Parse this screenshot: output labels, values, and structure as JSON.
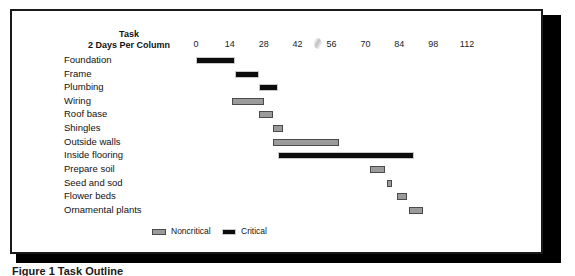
{
  "figure": {
    "caption": "Figure 1   Task Outline"
  },
  "header": {
    "task_line1": "Task",
    "task_line2": "2 Days Per Column"
  },
  "legend": {
    "items": [
      {
        "label": "Noncritical",
        "kind": "noncritical",
        "color": "#9b9b9b"
      },
      {
        "label": "Critical",
        "kind": "critical",
        "color": "#0c0c0c"
      }
    ]
  },
  "chart_data": {
    "type": "bar",
    "title": "Task Outline",
    "subtitle": "2 Days Per Column",
    "xlabel": "Days",
    "ylabel": "Task",
    "orientation": "horizontal",
    "grid": false,
    "legend_position": "bottom",
    "xlim": [
      0,
      126
    ],
    "xticks": [
      0,
      14,
      28,
      42,
      56,
      70,
      84,
      98,
      112
    ],
    "xtick_labels": [
      "0",
      "14",
      "28",
      "42",
      "56",
      "70",
      "84",
      "98",
      "112"
    ],
    "units": "days",
    "categories": [
      "Foundation",
      "Frame",
      "Plumbing",
      "Wiring",
      "Roof base",
      "Shingles",
      "Outside walls",
      "Inside flooring",
      "Prepare soil",
      "Seed and sod",
      "Flower beds",
      "Ornamental plants"
    ],
    "series": [
      {
        "name": "Critical",
        "color": "#0c0c0c",
        "tasks": [
          {
            "task": "Foundation",
            "start": 0,
            "end": 16,
            "duration": 16,
            "kind": "critical"
          },
          {
            "task": "Frame",
            "start": 16,
            "end": 26,
            "duration": 10,
            "kind": "critical"
          },
          {
            "task": "Plumbing",
            "start": 26,
            "end": 34,
            "duration": 8,
            "kind": "critical"
          },
          {
            "task": "Inside flooring",
            "start": 34,
            "end": 90,
            "duration": 56,
            "kind": "critical"
          }
        ]
      },
      {
        "name": "Noncritical",
        "color": "#9b9b9b",
        "tasks": [
          {
            "task": "Wiring",
            "start": 15,
            "end": 28,
            "duration": 13,
            "kind": "noncritical"
          },
          {
            "task": "Roof base",
            "start": 26,
            "end": 32,
            "duration": 6,
            "kind": "noncritical"
          },
          {
            "task": "Shingles",
            "start": 32,
            "end": 36,
            "duration": 4,
            "kind": "noncritical"
          },
          {
            "task": "Outside walls",
            "start": 32,
            "end": 59,
            "duration": 27,
            "kind": "noncritical"
          },
          {
            "task": "Prepare soil",
            "start": 72,
            "end": 78,
            "duration": 6,
            "kind": "noncritical"
          },
          {
            "task": "Seed and sod",
            "start": 79,
            "end": 81,
            "duration": 2,
            "kind": "noncritical"
          },
          {
            "task": "Flower beds",
            "start": 83,
            "end": 87,
            "duration": 4,
            "kind": "noncritical"
          },
          {
            "task": "Ornamental plants",
            "start": 88,
            "end": 94,
            "duration": 6,
            "kind": "noncritical"
          }
        ]
      }
    ],
    "bars": [
      {
        "task": "Foundation",
        "start": 0,
        "end": 16,
        "kind": "critical"
      },
      {
        "task": "Frame",
        "start": 16,
        "end": 26,
        "kind": "critical"
      },
      {
        "task": "Plumbing",
        "start": 26,
        "end": 34,
        "kind": "critical"
      },
      {
        "task": "Wiring",
        "start": 15,
        "end": 28,
        "kind": "noncritical"
      },
      {
        "task": "Roof base",
        "start": 26,
        "end": 32,
        "kind": "noncritical"
      },
      {
        "task": "Shingles",
        "start": 32,
        "end": 36,
        "kind": "noncritical"
      },
      {
        "task": "Outside walls",
        "start": 32,
        "end": 59,
        "kind": "noncritical"
      },
      {
        "task": "Inside flooring",
        "start": 34,
        "end": 90,
        "kind": "critical"
      },
      {
        "task": "Prepare soil",
        "start": 72,
        "end": 78,
        "kind": "noncritical"
      },
      {
        "task": "Seed and sod",
        "start": 79,
        "end": 81,
        "kind": "noncritical"
      },
      {
        "task": "Flower beds",
        "start": 83,
        "end": 87,
        "kind": "noncritical"
      },
      {
        "task": "Ornamental plants",
        "start": 88,
        "end": 94,
        "kind": "noncritical"
      }
    ]
  }
}
